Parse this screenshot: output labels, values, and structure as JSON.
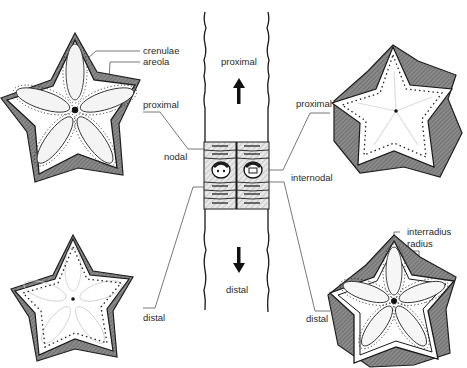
{
  "diagram": {
    "stem": {
      "top_label": "proximal",
      "bottom_label": "distal",
      "node_label": "nodal",
      "internode_label": "internodal"
    },
    "panels": [
      {
        "id": "top-left",
        "description": "nodal proximal facet",
        "labels": [
          "crenulae",
          "areola",
          "proximal"
        ]
      },
      {
        "id": "bottom-left",
        "description": "nodal distal facet",
        "labels": [
          "distal"
        ]
      },
      {
        "id": "top-right",
        "description": "internodal proximal facet",
        "labels": [
          "proximal"
        ]
      },
      {
        "id": "bottom-right",
        "description": "internodal distal facet",
        "labels": [
          "interradius",
          "radius",
          "distal"
        ]
      }
    ]
  },
  "labels": {
    "crenulae": "crenulae",
    "areola": "areola",
    "left_proximal": "proximal",
    "nodal": "nodal",
    "left_distal": "distal",
    "stem_proximal": "proximal",
    "stem_distal": "distal",
    "right_proximal": "proximal",
    "internodal": "internodal",
    "interradius": "interradius",
    "radius": "radius",
    "right_distal": "distal"
  },
  "colors": {
    "ink": "#1a1a1a",
    "shade": "#7a7a7a",
    "light_shade": "#bdbdbd",
    "background": "#ffffff"
  }
}
